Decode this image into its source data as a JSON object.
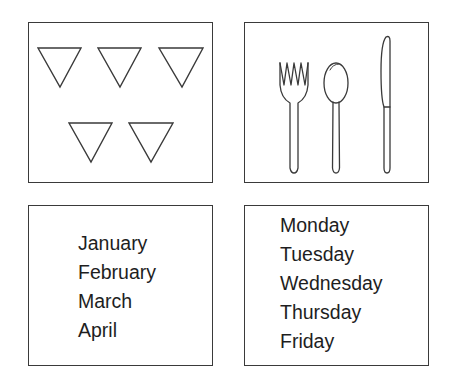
{
  "panels": [
    {
      "id": "triangles",
      "content": "five downward-pointing triangles",
      "count": 5
    },
    {
      "id": "cutlery",
      "items": [
        "fork",
        "spoon",
        "knife"
      ]
    },
    {
      "id": "months",
      "words": [
        "January",
        "February",
        "March",
        "April"
      ]
    },
    {
      "id": "weekdays",
      "words": [
        "Monday",
        "Tuesday",
        "Wednesday",
        "Thursday",
        "Friday"
      ]
    }
  ],
  "colors": {
    "stroke": "#3a3a3a",
    "text": "#1e1e1e",
    "background": "#ffffff"
  }
}
